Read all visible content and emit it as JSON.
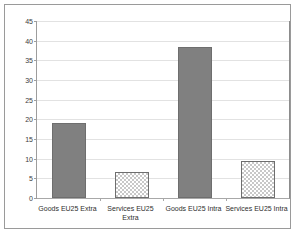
{
  "chart_data": {
    "type": "bar",
    "title": "",
    "subtitle": "",
    "xlabel": "",
    "ylabel": "",
    "categories": [
      "Goods EU25 Extra",
      "Services EU25 Extra",
      "Goods EU25 Intra",
      "Services EU25 Intra"
    ],
    "values": [
      19.0,
      6.5,
      38.5,
      9.3
    ],
    "series": [
      {
        "name": "Share",
        "values": [
          19.0,
          6.5,
          38.5,
          9.3
        ]
      }
    ],
    "ylim": [
      0,
      45
    ],
    "yticks": [
      0,
      5,
      10,
      15,
      20,
      25,
      30,
      35,
      40,
      45
    ],
    "ytick_labels": [
      "0",
      "5",
      "10",
      "15",
      "20",
      "25",
      "30",
      "35",
      "40",
      "45"
    ],
    "grid": true,
    "grid_axis": "y",
    "legend": false,
    "legend_position": "none",
    "bar_fills": [
      "solid",
      "checker",
      "solid",
      "checker"
    ],
    "colors": {
      "bar_solid": "#808080",
      "bar_checker": "#c8c8c8",
      "bar_border": "#6e6e6e",
      "gridline": "#e2e2e2",
      "axis": "#9d9d9d",
      "frame": "#9a9a9a",
      "background": "#ffffff",
      "text": "#2e2e2e"
    }
  }
}
